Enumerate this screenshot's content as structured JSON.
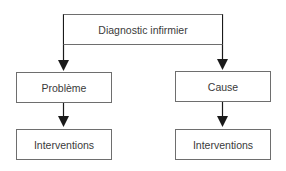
{
  "diagram": {
    "root": {
      "label": "Diagnostic infirmier"
    },
    "branches": [
      {
        "label": "Problème",
        "child": {
          "label": "Interventions"
        }
      },
      {
        "label": "Cause",
        "child": {
          "label": "Interventions"
        }
      }
    ],
    "colors": {
      "border": "#6e6e6e",
      "arrow": "#1a1a1a",
      "text": "#3a3a3a"
    }
  }
}
